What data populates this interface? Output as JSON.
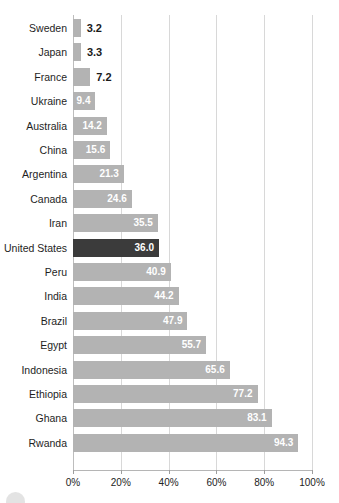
{
  "chart_data": {
    "type": "bar",
    "orientation": "horizontal",
    "title": "",
    "xlabel": "",
    "ylabel": "",
    "xlim": [
      0,
      100
    ],
    "grid": true,
    "legend": "none",
    "value_suffix": "",
    "axis_tick_suffix": "%",
    "categories": [
      "Sweden",
      "Japan",
      "France",
      "Ukraine",
      "Australia",
      "China",
      "Argentina",
      "Canada",
      "Iran",
      "United States",
      "Peru",
      "India",
      "Brazil",
      "Egypt",
      "Indonesia",
      "Ethiopia",
      "Ghana",
      "Rwanda"
    ],
    "values": [
      3.2,
      3.3,
      7.2,
      9.4,
      14.2,
      15.6,
      21.3,
      24.6,
      35.5,
      36.0,
      40.9,
      44.2,
      47.9,
      55.7,
      65.6,
      77.2,
      83.1,
      94.3
    ],
    "value_labels": [
      "3.2",
      "3.3",
      "7.2",
      "9.4",
      "14.2",
      "15.6",
      "21.3",
      "24.6",
      "35.5",
      "36.0",
      "40.9",
      "44.2",
      "47.9",
      "55.7",
      "65.6",
      "77.2",
      "83.1",
      "94.3"
    ],
    "highlighted_category": "United States",
    "xticks": [
      0,
      20,
      40,
      60,
      80,
      100
    ],
    "xtick_labels": [
      "0%",
      "20%",
      "40%",
      "60%",
      "80%",
      "100%"
    ],
    "colors": {
      "bar": "#b3b3b3",
      "bar_highlight": "#3b3b3b",
      "gridline": "#d8d8d8",
      "axis": "#b5b5b5",
      "label_text": "#1e1e1e",
      "value_text_inside": "#ffffff",
      "value_text_outside": "#1a1a1a",
      "background": "#ffffff"
    }
  },
  "footer": {
    "mark": "circle-mark"
  }
}
